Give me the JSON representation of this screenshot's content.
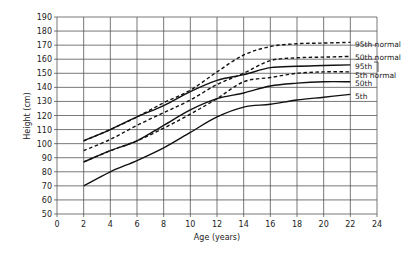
{
  "chart_data": {
    "type": "line",
    "title": "",
    "xlabel": "Age (years)",
    "ylabel": "Height (cm)",
    "xlim": [
      0,
      24
    ],
    "ylim": [
      50,
      190
    ],
    "xticks": [
      0,
      2,
      4,
      6,
      8,
      10,
      12,
      14,
      16,
      18,
      20,
      22,
      24
    ],
    "yticks": [
      50,
      60,
      70,
      80,
      90,
      100,
      110,
      120,
      130,
      140,
      150,
      160,
      170,
      180,
      190
    ],
    "grid": true,
    "legend_position": "right, inline labels at line ends",
    "x": [
      2,
      4,
      6,
      8,
      10,
      12,
      14,
      16,
      18,
      20,
      22
    ],
    "series": [
      {
        "name": "95th normal",
        "style": "dashed",
        "values": [
          102,
          110,
          119,
          129,
          138,
          151,
          163,
          169,
          171,
          171.5,
          172
        ]
      },
      {
        "name": "50th normal",
        "style": "dashed",
        "values": [
          95,
          103,
          113,
          122,
          131,
          142,
          150,
          159,
          161,
          161.5,
          162
        ]
      },
      {
        "name": "95th",
        "style": "solid",
        "values": [
          102,
          110,
          119,
          127,
          137,
          145,
          149,
          154,
          155,
          155.5,
          156
        ]
      },
      {
        "name": "5th normal",
        "style": "dashed",
        "values": [
          87,
          95,
          102,
          111,
          121,
          132,
          144,
          147,
          150,
          151,
          151
        ]
      },
      {
        "name": "50th",
        "style": "solid",
        "values": [
          87,
          95,
          102,
          113,
          124,
          132,
          136,
          141,
          143,
          144,
          144
        ]
      },
      {
        "name": "5th",
        "style": "solid",
        "values": [
          70,
          80,
          88,
          97,
          108,
          119,
          126,
          128,
          131,
          133,
          135
        ]
      }
    ]
  }
}
